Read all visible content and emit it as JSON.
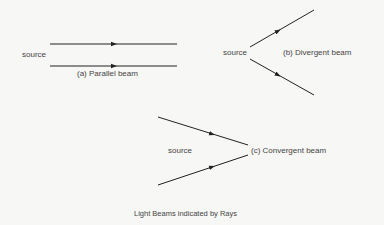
{
  "diagram": {
    "caption": "Light Beams indicated by Rays",
    "panels": [
      {
        "id": "a",
        "source_label": "source",
        "title": "(a) Parallel beam"
      },
      {
        "id": "b",
        "source_label": "source",
        "title": "(b) Divergent beam"
      },
      {
        "id": "c",
        "source_label": "source",
        "title": "(c) Convergent beam"
      }
    ],
    "colors": {
      "ray": "#222222",
      "background": "#f7f7f5",
      "text": "#444444"
    }
  }
}
